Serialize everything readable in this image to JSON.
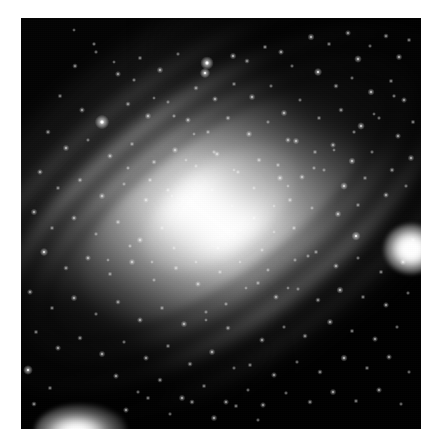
{
  "image": {
    "kind": "astronomical-photograph",
    "subject": "Andromeda Galaxy (M31) spiral galaxy",
    "palette": "grayscale",
    "orientation": "major axis runs upper-left to lower-right, tilted about -36 degrees",
    "canvas_width": 442,
    "canvas_height": 448,
    "plate_left": 21,
    "plate_top": 18,
    "plate_width": 400,
    "plate_height": 411,
    "border_color": "#ffffff",
    "sky_color": "#040404",
    "core_color": "#ffffff",
    "halo_color": "#b4b4b4",
    "dust_color": "#000000",
    "alt_text": "Grayscale telescope image of a large inclined spiral galaxy with a brilliant elongated core, dark dust lanes crossing the lower right disc, a bright round companion galaxy at the right edge and an elongated companion galaxy at the lower left, set against a dense field of point-like stars."
  },
  "features": [
    {
      "name": "galaxy-core",
      "label": "Bright elongated galactic nucleus",
      "cx": 196,
      "cy": 218,
      "brightness": 255
    },
    {
      "name": "galaxy-bulge",
      "label": "Inner bulge",
      "cx": 196,
      "cy": 218,
      "brightness": 240
    },
    {
      "name": "galaxy-halo",
      "label": "Outer disc and halo",
      "cx": 196,
      "cy": 218,
      "brightness": 150
    },
    {
      "name": "dust-lane-upper",
      "label": "Dust lane north-west of nucleus",
      "brightness": 60
    },
    {
      "name": "dust-lane-lower",
      "label": "Broad dark dust lane south-east of nucleus",
      "brightness": 20
    },
    {
      "name": "companion-galaxy-right",
      "label": "Round companion galaxy near right edge",
      "cx": 389,
      "cy": 231,
      "brightness": 255
    },
    {
      "name": "companion-galaxy-lower-left",
      "label": "Elongated companion galaxy at lower left",
      "cx": 60,
      "cy": 413,
      "brightness": 255
    },
    {
      "name": "foreground-star-bright-upper",
      "label": "Bright foreground star above the disc",
      "cx": 207,
      "cy": 63,
      "brightness": 250
    },
    {
      "name": "foreground-star-left",
      "label": "Bright foreground star on the north-west arm",
      "cx": 102,
      "cy": 122,
      "brightness": 245
    }
  ],
  "stars": [
    [
      207,
      63,
      2.6,
      1.0
    ],
    [
      205,
      73,
      2.0,
      0.92
    ],
    [
      233,
      56,
      1.3,
      0.7
    ],
    [
      247,
      61,
      1.1,
      0.6
    ],
    [
      265,
      47,
      1.0,
      0.6
    ],
    [
      281,
      52,
      1.2,
      0.65
    ],
    [
      292,
      66,
      0.9,
      0.5
    ],
    [
      311,
      37,
      1.4,
      0.7
    ],
    [
      329,
      44,
      1.0,
      0.55
    ],
    [
      348,
      33,
      1.2,
      0.62
    ],
    [
      358,
      59,
      1.5,
      0.75
    ],
    [
      370,
      46,
      0.9,
      0.5
    ],
    [
      386,
      36,
      1.1,
      0.6
    ],
    [
      399,
      57,
      1.3,
      0.68
    ],
    [
      409,
      40,
      1.0,
      0.55
    ],
    [
      318,
      72,
      1.6,
      0.8
    ],
    [
      336,
      86,
      1.1,
      0.6
    ],
    [
      352,
      78,
      0.9,
      0.5
    ],
    [
      371,
      92,
      1.4,
      0.72
    ],
    [
      391,
      81,
      1.0,
      0.56
    ],
    [
      404,
      100,
      1.2,
      0.64
    ],
    [
      300,
      100,
      0.9,
      0.5
    ],
    [
      284,
      113,
      1.3,
      0.68
    ],
    [
      319,
      118,
      1.0,
      0.55
    ],
    [
      341,
      110,
      1.1,
      0.6
    ],
    [
      361,
      126,
      1.5,
      0.78
    ],
    [
      379,
      118,
      0.9,
      0.5
    ],
    [
      398,
      136,
      1.2,
      0.64
    ],
    [
      413,
      122,
      1.0,
      0.56
    ],
    [
      296,
      141,
      1.3,
      0.7
    ],
    [
      315,
      152,
      1.0,
      0.55
    ],
    [
      333,
      145,
      1.2,
      0.62
    ],
    [
      352,
      161,
      1.4,
      0.74
    ],
    [
      372,
      152,
      0.9,
      0.5
    ],
    [
      392,
      170,
      1.1,
      0.6
    ],
    [
      411,
      158,
      1.3,
      0.68
    ],
    [
      278,
      165,
      1.0,
      0.55
    ],
    [
      302,
      177,
      1.2,
      0.63
    ],
    [
      324,
      170,
      0.9,
      0.5
    ],
    [
      344,
      186,
      1.5,
      0.78
    ],
    [
      365,
      178,
      1.0,
      0.55
    ],
    [
      386,
      195,
      1.2,
      0.64
    ],
    [
      406,
      186,
      0.9,
      0.5
    ],
    [
      290,
      200,
      1.1,
      0.6
    ],
    [
      312,
      208,
      0.9,
      0.5
    ],
    [
      338,
      214,
      1.3,
      0.7
    ],
    [
      358,
      205,
      1.0,
      0.55
    ],
    [
      356,
      236,
      1.8,
      0.85
    ],
    [
      413,
      240,
      1.1,
      0.6
    ],
    [
      403,
      262,
      1.3,
      0.68
    ],
    [
      381,
      272,
      1.0,
      0.55
    ],
    [
      358,
      258,
      0.9,
      0.5
    ],
    [
      336,
      266,
      1.2,
      0.64
    ],
    [
      316,
      252,
      1.0,
      0.55
    ],
    [
      295,
      260,
      0.9,
      0.5
    ],
    [
      340,
      290,
      1.4,
      0.72
    ],
    [
      363,
      297,
      1.0,
      0.55
    ],
    [
      386,
      305,
      1.2,
      0.64
    ],
    [
      408,
      293,
      0.9,
      0.5
    ],
    [
      318,
      300,
      1.1,
      0.6
    ],
    [
      298,
      289,
      0.9,
      0.5
    ],
    [
      276,
      297,
      1.2,
      0.62
    ],
    [
      258,
      283,
      1.0,
      0.55
    ],
    [
      330,
      322,
      1.3,
      0.68
    ],
    [
      352,
      331,
      1.0,
      0.55
    ],
    [
      375,
      339,
      1.2,
      0.64
    ],
    [
      397,
      327,
      0.9,
      0.5
    ],
    [
      305,
      336,
      1.1,
      0.6
    ],
    [
      284,
      327,
      0.9,
      0.5
    ],
    [
      262,
      340,
      1.2,
      0.62
    ],
    [
      344,
      358,
      1.4,
      0.72
    ],
    [
      367,
      368,
      1.0,
      0.55
    ],
    [
      389,
      357,
      1.2,
      0.64
    ],
    [
      409,
      372,
      0.9,
      0.5
    ],
    [
      320,
      372,
      1.1,
      0.6
    ],
    [
      297,
      362,
      0.9,
      0.5
    ],
    [
      274,
      375,
      1.2,
      0.62
    ],
    [
      250,
      365,
      1.0,
      0.55
    ],
    [
      333,
      392,
      1.3,
      0.68
    ],
    [
      356,
      401,
      1.0,
      0.55
    ],
    [
      379,
      390,
      1.2,
      0.64
    ],
    [
      401,
      404,
      0.9,
      0.5
    ],
    [
      310,
      402,
      1.1,
      0.6
    ],
    [
      286,
      393,
      0.9,
      0.5
    ],
    [
      263,
      405,
      1.2,
      0.62
    ],
    [
      102,
      122,
      2.8,
      1.0
    ],
    [
      75,
      66,
      1.1,
      0.6
    ],
    [
      96,
      52,
      0.9,
      0.5
    ],
    [
      118,
      74,
      1.2,
      0.62
    ],
    [
      140,
      58,
      1.0,
      0.55
    ],
    [
      160,
      70,
      1.3,
      0.68
    ],
    [
      178,
      54,
      0.9,
      0.5
    ],
    [
      196,
      88,
      1.1,
      0.6
    ],
    [
      215,
      99,
      1.2,
      0.64
    ],
    [
      234,
      84,
      1.0,
      0.55
    ],
    [
      252,
      97,
      1.3,
      0.68
    ],
    [
      271,
      86,
      0.9,
      0.5
    ],
    [
      60,
      96,
      1.0,
      0.55
    ],
    [
      82,
      110,
      1.2,
      0.62
    ],
    [
      128,
      104,
      1.1,
      0.6
    ],
    [
      148,
      116,
      1.3,
      0.68
    ],
    [
      168,
      102,
      0.9,
      0.5
    ],
    [
      188,
      120,
      1.2,
      0.64
    ],
    [
      208,
      132,
      1.0,
      0.55
    ],
    [
      228,
      118,
      1.1,
      0.6
    ],
    [
      249,
      134,
      1.3,
      0.68
    ],
    [
      268,
      122,
      0.9,
      0.5
    ],
    [
      288,
      140,
      1.2,
      0.62
    ],
    [
      48,
      132,
      1.1,
      0.6
    ],
    [
      66,
      148,
      1.3,
      0.68
    ],
    [
      88,
      140,
      0.9,
      0.5
    ],
    [
      110,
      156,
      1.2,
      0.64
    ],
    [
      132,
      144,
      1.0,
      0.55
    ],
    [
      154,
      162,
      1.1,
      0.6
    ],
    [
      175,
      150,
      1.3,
      0.68
    ],
    [
      196,
      166,
      0.9,
      0.5
    ],
    [
      217,
      154,
      1.2,
      0.62
    ],
    [
      238,
      172,
      1.0,
      0.55
    ],
    [
      259,
      160,
      1.1,
      0.6
    ],
    [
      280,
      178,
      1.3,
      0.68
    ],
    [
      40,
      172,
      1.2,
      0.64
    ],
    [
      58,
      188,
      1.0,
      0.55
    ],
    [
      80,
      180,
      1.1,
      0.6
    ],
    [
      102,
      196,
      1.3,
      0.68
    ],
    [
      124,
      184,
      0.9,
      0.5
    ],
    [
      146,
      200,
      1.2,
      0.62
    ],
    [
      168,
      190,
      1.0,
      0.55
    ],
    [
      190,
      206,
      1.1,
      0.6
    ],
    [
      34,
      212,
      1.3,
      0.68
    ],
    [
      52,
      228,
      1.0,
      0.55
    ],
    [
      74,
      218,
      1.2,
      0.64
    ],
    [
      96,
      234,
      0.9,
      0.5
    ],
    [
      118,
      222,
      1.1,
      0.6
    ],
    [
      140,
      240,
      1.3,
      0.68
    ],
    [
      162,
      228,
      1.0,
      0.55
    ],
    [
      44,
      252,
      1.6,
      0.8
    ],
    [
      66,
      268,
      1.1,
      0.6
    ],
    [
      88,
      258,
      1.2,
      0.64
    ],
    [
      110,
      274,
      1.0,
      0.55
    ],
    [
      132,
      262,
      1.3,
      0.68
    ],
    [
      154,
      280,
      0.9,
      0.5
    ],
    [
      176,
      268,
      1.1,
      0.6
    ],
    [
      198,
      284,
      1.2,
      0.62
    ],
    [
      220,
      272,
      1.0,
      0.55
    ],
    [
      30,
      292,
      1.2,
      0.64
    ],
    [
      52,
      308,
      1.0,
      0.55
    ],
    [
      74,
      298,
      1.3,
      0.68
    ],
    [
      96,
      314,
      0.9,
      0.5
    ],
    [
      118,
      302,
      1.1,
      0.6
    ],
    [
      140,
      320,
      1.2,
      0.64
    ],
    [
      162,
      308,
      1.0,
      0.55
    ],
    [
      184,
      324,
      1.3,
      0.68
    ],
    [
      206,
      312,
      0.9,
      0.5
    ],
    [
      228,
      328,
      1.1,
      0.6
    ],
    [
      36,
      332,
      1.0,
      0.55
    ],
    [
      58,
      348,
      1.2,
      0.64
    ],
    [
      80,
      338,
      1.1,
      0.6
    ],
    [
      102,
      354,
      1.3,
      0.68
    ],
    [
      124,
      342,
      0.9,
      0.5
    ],
    [
      146,
      358,
      1.2,
      0.62
    ],
    [
      168,
      346,
      1.0,
      0.55
    ],
    [
      190,
      364,
      1.1,
      0.6
    ],
    [
      212,
      352,
      1.3,
      0.68
    ],
    [
      234,
      368,
      0.9,
      0.5
    ],
    [
      28,
      370,
      1.9,
      0.88
    ],
    [
      50,
      388,
      1.0,
      0.55
    ],
    [
      116,
      376,
      1.2,
      0.64
    ],
    [
      138,
      392,
      0.9,
      0.5
    ],
    [
      160,
      380,
      1.1,
      0.6
    ],
    [
      182,
      398,
      1.3,
      0.68
    ],
    [
      204,
      386,
      1.0,
      0.55
    ],
    [
      226,
      402,
      1.2,
      0.62
    ],
    [
      248,
      390,
      0.9,
      0.5
    ],
    [
      34,
      404,
      1.1,
      0.6
    ],
    [
      126,
      410,
      1.2,
      0.64
    ],
    [
      148,
      398,
      1.0,
      0.55
    ],
    [
      170,
      414,
      0.9,
      0.5
    ],
    [
      192,
      402,
      1.1,
      0.6
    ],
    [
      214,
      418,
      1.3,
      0.68
    ],
    [
      236,
      406,
      1.0,
      0.55
    ],
    [
      258,
      420,
      0.9,
      0.5
    ],
    [
      150,
      180,
      1.0,
      0.6
    ],
    [
      172,
      196,
      0.8,
      0.5
    ],
    [
      128,
      168,
      0.9,
      0.55
    ],
    [
      186,
      160,
      0.8,
      0.5
    ],
    [
      212,
      190,
      0.9,
      0.55
    ],
    [
      232,
      206,
      0.8,
      0.5
    ],
    [
      254,
      218,
      1.0,
      0.6
    ],
    [
      274,
      232,
      0.8,
      0.5
    ],
    [
      262,
      250,
      0.9,
      0.55
    ],
    [
      240,
      262,
      0.8,
      0.5
    ],
    [
      218,
      248,
      1.0,
      0.6
    ],
    [
      196,
      262,
      0.8,
      0.5
    ],
    [
      174,
      248,
      0.9,
      0.55
    ],
    [
      152,
      262,
      0.8,
      0.5
    ],
    [
      130,
      246,
      0.9,
      0.55
    ],
    [
      108,
      260,
      0.8,
      0.5
    ],
    [
      294,
      228,
      1.0,
      0.6
    ],
    [
      274,
      206,
      0.8,
      0.5
    ],
    [
      254,
      188,
      0.9,
      0.55
    ],
    [
      234,
      170,
      0.8,
      0.5
    ],
    [
      214,
      152,
      0.9,
      0.55
    ],
    [
      194,
      134,
      0.8,
      0.5
    ],
    [
      174,
      116,
      0.9,
      0.55
    ],
    [
      154,
      98,
      0.8,
      0.5
    ],
    [
      134,
      80,
      0.9,
      0.55
    ],
    [
      114,
      62,
      0.8,
      0.5
    ],
    [
      94,
      44,
      0.9,
      0.55
    ],
    [
      74,
      30,
      0.8,
      0.5
    ],
    [
      314,
      168,
      0.9,
      0.55
    ],
    [
      334,
      150,
      0.8,
      0.5
    ],
    [
      354,
      132,
      0.9,
      0.55
    ],
    [
      374,
      114,
      0.8,
      0.5
    ],
    [
      394,
      96,
      0.9,
      0.55
    ],
    [
      288,
      186,
      0.8,
      0.5
    ],
    [
      268,
      270,
      0.9,
      0.55
    ],
    [
      288,
      288,
      0.8,
      0.5
    ],
    [
      308,
      256,
      0.9,
      0.55
    ],
    [
      246,
      288,
      0.8,
      0.5
    ],
    [
      226,
      304,
      0.9,
      0.55
    ],
    [
      206,
      320,
      0.8,
      0.5
    ]
  ]
}
